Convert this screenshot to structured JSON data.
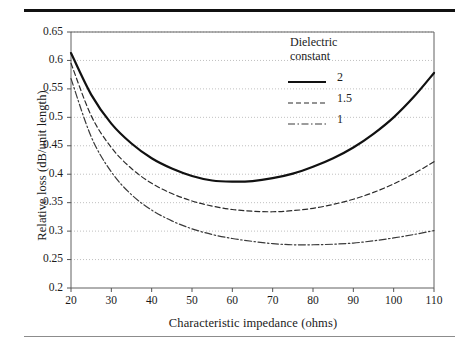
{
  "figure": {
    "rule_top": "thick-rule",
    "rule_bottom": "thin-rule"
  },
  "chart_data": {
    "type": "line",
    "title": "",
    "xlabel": "Characteristic impedance (ohms)",
    "ylabel": "Relative loss (dB/unit length)",
    "xlim": [
      20,
      110
    ],
    "ylim": [
      0.2,
      0.65
    ],
    "xticks": [
      20,
      30,
      40,
      50,
      60,
      70,
      80,
      90,
      100,
      110
    ],
    "xtick_labels": [
      "20",
      "30",
      "40",
      "50",
      "60",
      "70",
      "80",
      "90",
      "100",
      "110"
    ],
    "yticks": [
      0.2,
      0.25,
      0.3,
      0.35,
      0.4,
      0.45,
      0.5,
      0.55,
      0.6,
      0.65
    ],
    "ytick_labels": [
      "0.2",
      "0.25",
      "0.3",
      "0.35",
      "0.4",
      "0.45",
      "0.5",
      "0.55",
      "0.6",
      "0.65"
    ],
    "grid": "horizontal-dotted",
    "legend_position": "upper-right-inside",
    "legend_title": "Dielectric constant",
    "series": [
      {
        "name": "2",
        "style": "solid",
        "color": "#111111",
        "x": [
          20,
          25,
          30,
          35,
          40,
          45,
          50,
          55,
          60,
          65,
          70,
          75,
          80,
          85,
          90,
          95,
          100,
          105,
          110
        ],
        "values": [
          0.613,
          0.54,
          0.489,
          0.454,
          0.428,
          0.41,
          0.397,
          0.389,
          0.387,
          0.388,
          0.393,
          0.401,
          0.413,
          0.428,
          0.447,
          0.471,
          0.5,
          0.536,
          0.578
        ]
      },
      {
        "name": "1.5",
        "style": "dashed",
        "color": "#2b2b2b",
        "x": [
          20,
          25,
          30,
          35,
          40,
          45,
          50,
          55,
          60,
          65,
          70,
          75,
          80,
          85,
          90,
          95,
          100,
          105,
          110
        ],
        "values": [
          0.595,
          0.503,
          0.447,
          0.41,
          0.384,
          0.366,
          0.353,
          0.344,
          0.338,
          0.335,
          0.334,
          0.336,
          0.34,
          0.347,
          0.356,
          0.368,
          0.383,
          0.401,
          0.422
        ]
      },
      {
        "name": "1",
        "style": "dashdot",
        "color": "#3a3a3a",
        "x": [
          20,
          25,
          30,
          35,
          40,
          45,
          50,
          55,
          60,
          65,
          70,
          75,
          80,
          85,
          90,
          95,
          100,
          105,
          110
        ],
        "values": [
          0.568,
          0.466,
          0.404,
          0.364,
          0.337,
          0.318,
          0.304,
          0.294,
          0.287,
          0.282,
          0.278,
          0.276,
          0.276,
          0.277,
          0.279,
          0.283,
          0.288,
          0.294,
          0.301
        ]
      }
    ]
  }
}
